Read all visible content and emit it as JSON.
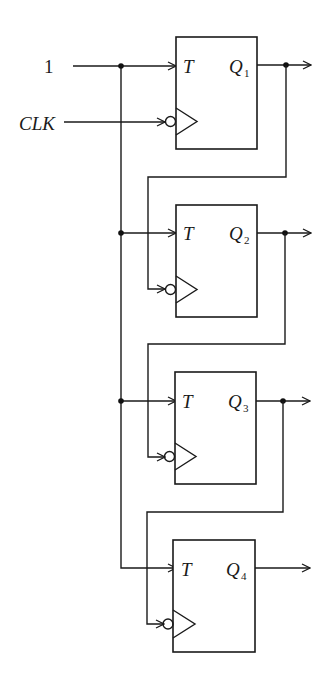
{
  "diagram": {
    "type": "circuit-schematic",
    "inputs": {
      "one_label": "1",
      "clock_label": "CLK"
    },
    "flip_flops": [
      {
        "id": "ff1",
        "input_label": "T",
        "output_label": "Q",
        "output_sub": "1",
        "clock_source": "CLK"
      },
      {
        "id": "ff2",
        "input_label": "T",
        "output_label": "Q",
        "output_sub": "2",
        "clock_source": "Q1"
      },
      {
        "id": "ff3",
        "input_label": "T",
        "output_label": "Q",
        "output_sub": "3",
        "clock_source": "Q2"
      },
      {
        "id": "ff4",
        "input_label": "T",
        "output_label": "Q",
        "output_sub": "4",
        "clock_source": "Q3"
      }
    ],
    "clock_edge": "negative (inverted bubble)",
    "colors": {
      "line": "#1a1a1a",
      "background": "#ffffff"
    }
  }
}
